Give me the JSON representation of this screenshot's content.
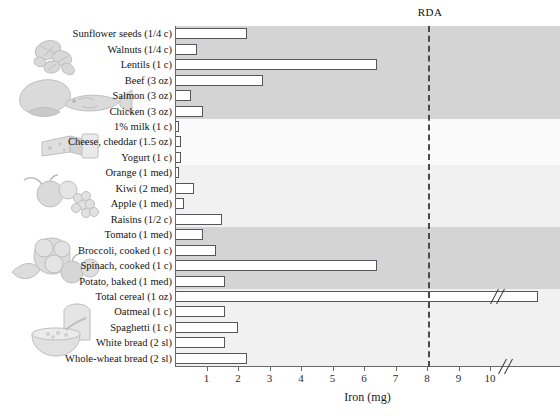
{
  "chart_data": {
    "type": "bar",
    "orientation": "horizontal",
    "title": "",
    "xlabel": "Iron (mg)",
    "ylabel": "",
    "xlim": [
      0,
      11.2
    ],
    "xticks": [
      1,
      2,
      3,
      4,
      5,
      6,
      7,
      8,
      9,
      10
    ],
    "grid": false,
    "axis_break": true,
    "annotations": [
      {
        "name": "RDA",
        "label": "RDA",
        "value": 8,
        "style": "dashed-vertical-line"
      }
    ],
    "categories": [
      "Sunflower seeds (1/4 c)",
      "Walnuts (1/4 c)",
      "Lentils (1 c)",
      "Beef (3 oz)",
      "Salmon (3 oz)",
      "Chicken (3 oz)",
      "1% milk (1 c)",
      "Cheese, cheddar (1.5 oz)",
      "Yogurt (1 c)",
      "Orange (1 med)",
      "Kiwi (2 med)",
      "Apple (1 med)",
      "Raisins (1/2 c)",
      "Tomato (1 med)",
      "Broccoli, cooked (1 c)",
      "Spinach, cooked (1 c)",
      "Potato, baked (1 med)",
      "Total cereal (1 oz)",
      "Oatmeal (1 c)",
      "Spaghetti (1 c)",
      "White bread (2 sl)",
      "Whole-wheat bread (2 sl)"
    ],
    "values": [
      2.3,
      0.7,
      6.4,
      2.8,
      0.5,
      0.9,
      0.1,
      0.2,
      0.2,
      0.1,
      0.6,
      0.3,
      1.5,
      0.9,
      1.3,
      6.4,
      1.6,
      18.0,
      1.6,
      2.0,
      1.6,
      2.3
    ],
    "value_display_notes": {
      "Total cereal (1 oz)": "bar extends beyond axis break at 10 mg"
    },
    "groups": [
      {
        "name": "nuts-seeds-legumes",
        "categories": [
          "Sunflower seeds (1/4 c)",
          "Walnuts (1/4 c)",
          "Lentils (1 c)"
        ],
        "shade": "dark"
      },
      {
        "name": "meat-fish-poultry",
        "categories": [
          "Beef (3 oz)",
          "Salmon (3 oz)",
          "Chicken (3 oz)"
        ],
        "shade": "dark"
      },
      {
        "name": "dairy",
        "categories": [
          "1% milk (1 c)",
          "Cheese, cheddar (1.5 oz)",
          "Yogurt (1 c)"
        ],
        "shade": "lighter"
      },
      {
        "name": "fruit",
        "categories": [
          "Orange (1 med)",
          "Kiwi (2 med)",
          "Apple (1 med)",
          "Raisins (1/2 c)"
        ],
        "shade": "light"
      },
      {
        "name": "vegetables",
        "categories": [
          "Tomato (1 med)",
          "Broccoli, cooked (1 c)",
          "Spinach, cooked (1 c)",
          "Potato, baked (1 med)"
        ],
        "shade": "dark"
      },
      {
        "name": "grains",
        "categories": [
          "Total cereal (1 oz)",
          "Oatmeal (1 c)",
          "Spaghetti (1 c)",
          "White bread (2 sl)",
          "Whole-wheat bread (2 sl)"
        ],
        "shade": "light"
      }
    ]
  },
  "axis": {
    "x_title": "Iron (mg)",
    "tick_labels": [
      "1",
      "2",
      "3",
      "4",
      "5",
      "6",
      "7",
      "8",
      "9",
      "10"
    ]
  },
  "rda": {
    "label": "RDA"
  },
  "illustrations": [
    {
      "name": "nuts-and-seeds-illustration"
    },
    {
      "name": "meat-fish-poultry-illustration"
    },
    {
      "name": "cheese-and-milk-illustration"
    },
    {
      "name": "fruit-illustration"
    },
    {
      "name": "vegetables-illustration"
    },
    {
      "name": "bread-and-cereal-illustration"
    }
  ]
}
